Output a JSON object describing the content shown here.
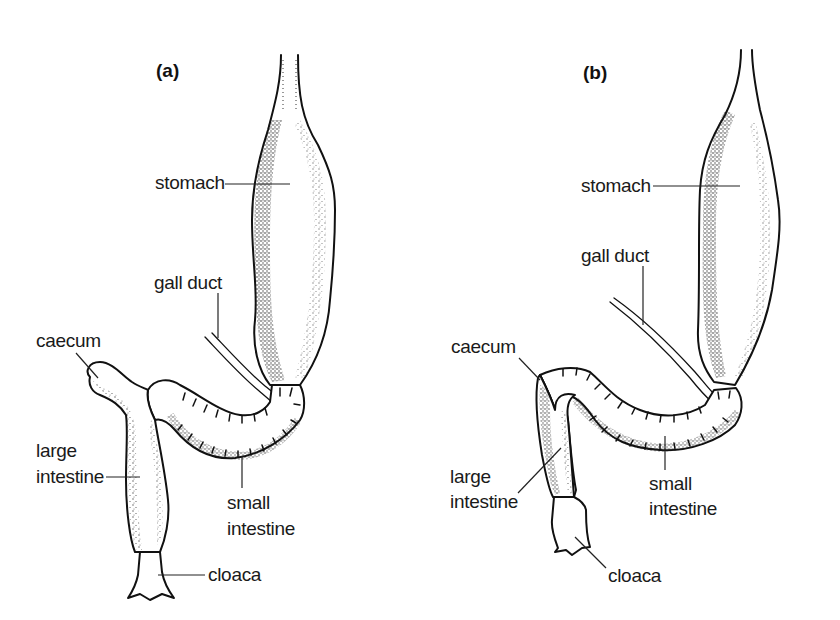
{
  "figure": {
    "panels": [
      {
        "id": "a",
        "label": "(a)",
        "parts": {
          "stomach": "stomach",
          "gall_duct": "gall duct",
          "caecum": "caecum",
          "large_intestine_1": "large",
          "large_intestine_2": "intestine",
          "small_intestine_1": "small",
          "small_intestine_2": "intestine",
          "cloaca": "cloaca"
        }
      },
      {
        "id": "b",
        "label": "(b)",
        "parts": {
          "stomach": "stomach",
          "gall_duct": "gall duct",
          "caecum": "caecum",
          "large_intestine_1": "large",
          "large_intestine_2": "intestine",
          "small_intestine_1": "small",
          "small_intestine_2": "intestine",
          "cloaca": "cloaca"
        }
      }
    ],
    "colors": {
      "ink": "#111111",
      "background": "#ffffff"
    }
  }
}
